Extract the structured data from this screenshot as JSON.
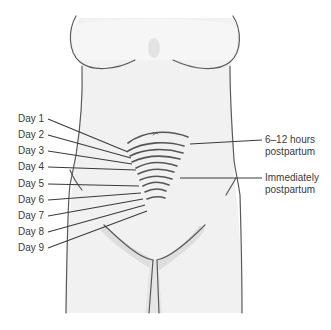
{
  "diagram": {
    "left_labels": [
      {
        "text": "Day 1",
        "y": 116
      },
      {
        "text": "Day 2",
        "y": 132
      },
      {
        "text": "Day 3",
        "y": 148
      },
      {
        "text": "Day 4",
        "y": 164
      },
      {
        "text": "Day 5",
        "y": 180
      },
      {
        "text": "Day 6",
        "y": 196
      },
      {
        "text": "Day 7",
        "y": 212
      },
      {
        "text": "Day 8",
        "y": 228
      },
      {
        "text": "Day 9",
        "y": 244
      }
    ],
    "right_labels": [
      {
        "line1": "6–12 hours",
        "line2": "postpartum"
      },
      {
        "line1": "Immediately",
        "line2": "postpartum"
      }
    ],
    "colors": {
      "outline": "#555555",
      "skin": "#f2f2f2",
      "shadow": "#d8d8d8",
      "text": "#3a3a3a"
    }
  }
}
